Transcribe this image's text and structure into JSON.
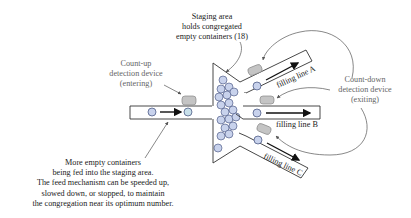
{
  "diagram": {
    "type": "flow-diagram",
    "colors": {
      "container_fill": "#c8d2ec",
      "container_stroke": "#3c4a78",
      "sensor_fill": "#c4c4c4",
      "sensor_stroke": "#888888",
      "outline": "#333333",
      "arrow": "#111111",
      "callout_arrow": "#555555"
    }
  },
  "labels": {
    "staging_area": {
      "lines": [
        "Staging area",
        "holds congregated",
        "empty containers (18)"
      ],
      "congregated_count": 18
    },
    "count_up": {
      "lines": [
        "Count-up",
        "detection device",
        "(entering)"
      ]
    },
    "count_down": {
      "lines": [
        "Count-down",
        "detection device",
        "(exiting)"
      ]
    },
    "feed_note": {
      "lines": [
        "More empty containers",
        "being fed into the staging area.",
        "The feed mechanism can be speeded up,",
        "slowed down, or stopped, to maintain",
        "the congregation near its optimum number."
      ]
    },
    "filling_lines": [
      {
        "id": "A",
        "label": "filling line A"
      },
      {
        "id": "B",
        "label": "filling line B"
      },
      {
        "id": "C",
        "label": "filling line C"
      }
    ]
  }
}
